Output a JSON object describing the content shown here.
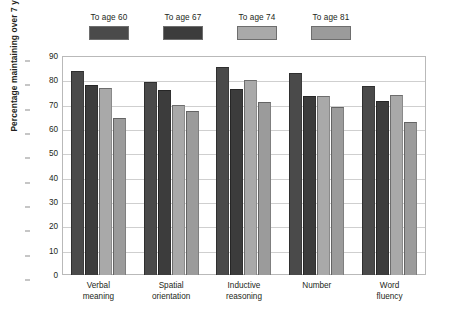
{
  "chart_data": {
    "type": "bar",
    "title": "",
    "xlabel": "",
    "ylabel": "Percentage maintaining over 7 years",
    "ylim": [
      0,
      90
    ],
    "yticks": [
      0,
      10,
      20,
      30,
      40,
      50,
      60,
      70,
      80,
      90
    ],
    "grid": true,
    "legend_position": "top",
    "categories": [
      "Verbal meaning",
      "Spatial orientation",
      "Inductive reasoning",
      "Number",
      "Word fluency"
    ],
    "category_lines": [
      [
        "Verbal",
        "meaning"
      ],
      [
        "Spatial",
        "orientation"
      ],
      [
        "Inductive",
        "reasoning"
      ],
      [
        "Number",
        ""
      ],
      [
        "Word",
        "fluency"
      ]
    ],
    "series": [
      {
        "name": "To age 60",
        "color": "#4a4a4a",
        "values": [
          84,
          79.5,
          85.5,
          83,
          77.5
        ]
      },
      {
        "name": "To age 67",
        "color": "#3c3c3c",
        "values": [
          78,
          76,
          76.5,
          73.5,
          71.5
        ]
      },
      {
        "name": "To age 74",
        "color": "#a9a9a9",
        "values": [
          77,
          70,
          80,
          73.5,
          74
        ]
      },
      {
        "name": "To age 81",
        "color": "#9b9b9b",
        "values": [
          64.5,
          67.5,
          71,
          69,
          63
        ]
      }
    ]
  }
}
